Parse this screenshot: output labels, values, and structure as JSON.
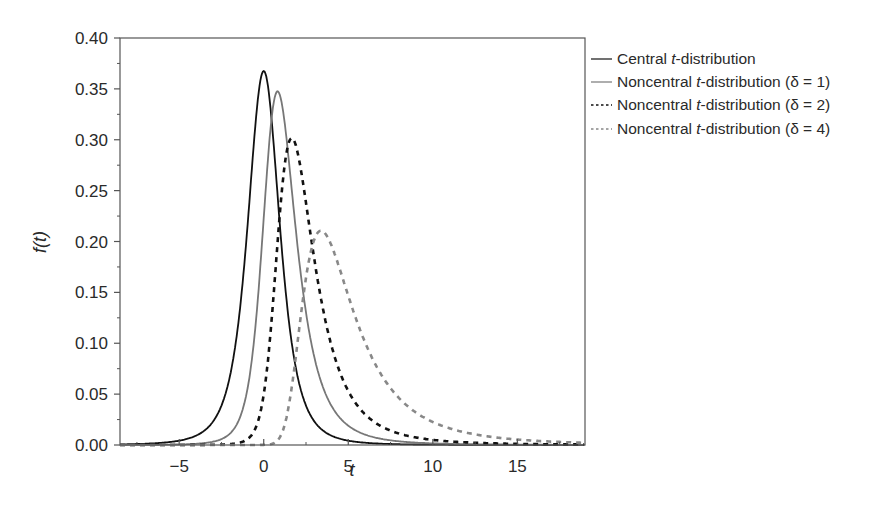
{
  "chart_data": {
    "type": "line",
    "title": "",
    "xlabel": "t",
    "ylabel": "f(t)",
    "xlim": [
      -8.5,
      19
    ],
    "ylim": [
      0,
      0.4
    ],
    "x_ticks": [
      -5,
      0,
      5,
      10,
      15
    ],
    "x_tick_labels": [
      "−5",
      "0",
      "5",
      "10",
      "15"
    ],
    "y_ticks": [
      0.0,
      0.05,
      0.1,
      0.15,
      0.2,
      0.25,
      0.3,
      0.35,
      0.4
    ],
    "y_tick_labels": [
      "0.00",
      "0.05",
      "0.10",
      "0.15",
      "0.20",
      "0.25",
      "0.30",
      "0.35",
      "0.40"
    ],
    "grid": false,
    "legend_position": "outside-right-top",
    "degrees_of_freedom": 3,
    "series": [
      {
        "name": "Central t-distribution",
        "delta": 0,
        "color": "#111111",
        "dash": "",
        "width": 1.8,
        "peak": {
          "t": 0.0,
          "f": 0.367
        },
        "x": [
          -8,
          -5,
          -3,
          -2,
          -1,
          0,
          1,
          2,
          3,
          5,
          10,
          15
        ],
        "values": [
          0.002,
          0.005,
          0.023,
          0.068,
          0.207,
          0.367,
          0.207,
          0.068,
          0.023,
          0.005,
          0.001,
          0.0
        ]
      },
      {
        "name": "Noncentral t-distribution (δ = 1)",
        "delta": 1,
        "color": "#777777",
        "dash": "",
        "width": 1.8,
        "peak": {
          "t": 0.9,
          "f": 0.347
        },
        "x": [
          -5,
          -3,
          -2,
          -1,
          0,
          1,
          2,
          3,
          4,
          5,
          7,
          10,
          15
        ],
        "values": [
          0.001,
          0.005,
          0.015,
          0.06,
          0.21,
          0.345,
          0.25,
          0.12,
          0.06,
          0.035,
          0.014,
          0.005,
          0.001
        ]
      },
      {
        "name": "Noncentral t-distribution (δ = 2)",
        "delta": 2,
        "color": "#111111",
        "dash": "5,5",
        "width": 2.6,
        "peak": {
          "t": 1.7,
          "f": 0.3
        },
        "x": [
          -3,
          -1,
          0,
          1,
          2,
          3,
          4,
          5,
          6,
          8,
          10,
          15
        ],
        "values": [
          0.001,
          0.01,
          0.05,
          0.2,
          0.295,
          0.2,
          0.12,
          0.075,
          0.05,
          0.022,
          0.012,
          0.004
        ]
      },
      {
        "name": "Noncentral t-distribution (δ = 4)",
        "delta": 4,
        "color": "#888888",
        "dash": "5,5",
        "width": 2.6,
        "peak": {
          "t": 3.5,
          "f": 0.21
        },
        "x": [
          0,
          1,
          2,
          3,
          3.5,
          4,
          5,
          6,
          7,
          8,
          10,
          12,
          15,
          19
        ],
        "values": [
          0.002,
          0.02,
          0.13,
          0.2,
          0.21,
          0.205,
          0.17,
          0.13,
          0.095,
          0.07,
          0.04,
          0.024,
          0.012,
          0.005
        ]
      }
    ]
  },
  "legend": {
    "items": [
      {
        "prefix": "Central ",
        "italic": "t",
        "suffix": "-distribution",
        "param": ""
      },
      {
        "prefix": "Noncentral ",
        "italic": "t",
        "suffix": "-distribution",
        "param": "(δ = 1)"
      },
      {
        "prefix": "Noncentral ",
        "italic": "t",
        "suffix": "-distribution",
        "param": "(δ = 2)"
      },
      {
        "prefix": "Noncentral ",
        "italic": "t",
        "suffix": "-distribution",
        "param": "(δ = 4)"
      }
    ]
  },
  "axes": {
    "xlabel": "t",
    "ylabel": "f(t)"
  }
}
